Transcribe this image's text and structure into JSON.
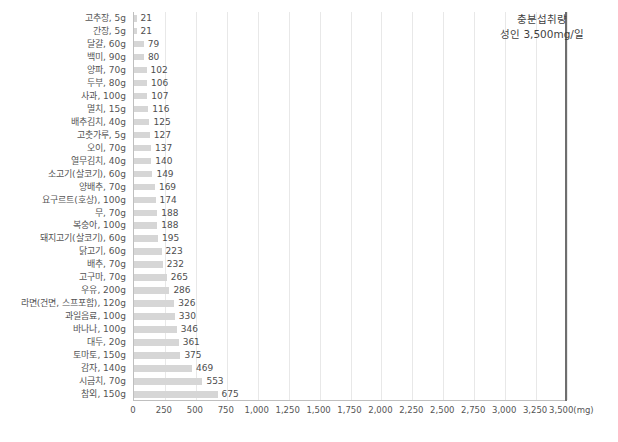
{
  "chart_data": {
    "type": "bar",
    "orientation": "horizontal",
    "title": "",
    "xlabel": "",
    "ylabel": "",
    "xlim": [
      0,
      3500
    ],
    "grid": true,
    "unit": "mg",
    "categories": [
      "고추장, 5g",
      "간장, 5g",
      "달걀, 60g",
      "백미, 90g",
      "양파, 70g",
      "두부, 80g",
      "사과, 100g",
      "멸치, 15g",
      "배추김치, 40g",
      "고춧가루, 5g",
      "오이, 70g",
      "열무김치, 40g",
      "소고기(살코기), 60g",
      "양배추, 70g",
      "요구르트(호상), 100g",
      "무, 70g",
      "복숭아, 100g",
      "돼지고기(살코기), 60g",
      "닭고기, 60g",
      "배추, 70g",
      "고구마, 70g",
      "우유, 200g",
      "라면(건면, 스프포함), 120g",
      "과일음료, 100g",
      "바나나, 100g",
      "대두, 20g",
      "토마토, 150g",
      "감자, 140g",
      "시금치, 70g",
      "참외, 150g"
    ],
    "values": [
      21,
      21,
      79,
      80,
      102,
      106,
      107,
      116,
      125,
      127,
      137,
      140,
      149,
      169,
      174,
      188,
      188,
      195,
      223,
      232,
      265,
      286,
      326,
      330,
      346,
      361,
      375,
      469,
      553,
      675
    ],
    "value_labels": [
      "21",
      "21",
      "79",
      "80",
      "102",
      "106",
      "107",
      "116",
      "125",
      "127",
      "137",
      "140",
      "149",
      "169",
      "174",
      "188",
      "188",
      "195",
      "223",
      "232",
      "265",
      "286",
      "326",
      "330",
      "346",
      "361",
      "375",
      "469",
      "553",
      "675"
    ],
    "xticks": [
      0,
      250,
      500,
      750,
      1000,
      1250,
      1500,
      1750,
      2000,
      2250,
      2500,
      2750,
      3000,
      3250,
      3500
    ],
    "xtick_labels": [
      "0",
      "250",
      "500",
      "750",
      "1,000",
      "1,250",
      "1,500",
      "1,750",
      "2,000",
      "2,250",
      "2,500",
      "2,750",
      "3,000",
      "3,250",
      "3,500(mg)"
    ],
    "reference_line": {
      "value": 3500,
      "label_line1": "충분섭취량",
      "label_line2": "성인 3,500mg/일",
      "color": "#6e6e6e"
    },
    "bar_color": "#d6d6d6",
    "gridline_color": "#e8e8e8",
    "axis_color": "#bfbfbf"
  },
  "caption": ""
}
